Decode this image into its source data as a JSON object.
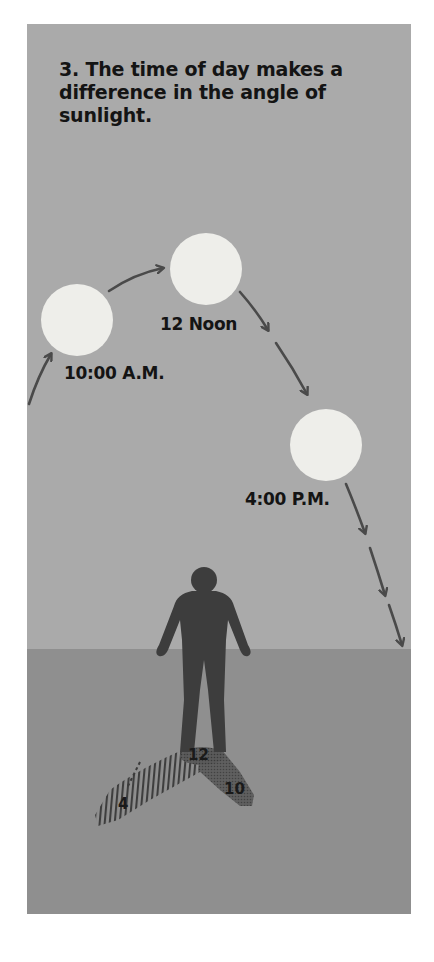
{
  "figure": {
    "title": "3. The time of day makes a difference in the angle of sunlight.",
    "colors": {
      "sky": "#aaaaaa",
      "ground": "#8f8f8f",
      "sun": "#eeeeea",
      "person": "#3d3d3d",
      "arrow": "#4a4a4a",
      "text": "#141414"
    },
    "suns": [
      {
        "id": "sun-10am",
        "label": "10:00 A.M."
      },
      {
        "id": "sun-noon",
        "label": "12 Noon"
      },
      {
        "id": "sun-4pm",
        "label": "4:00 P.M."
      }
    ],
    "shadows": [
      {
        "id": "shadow-noon",
        "label": "12"
      },
      {
        "id": "shadow-10am",
        "label": "10"
      },
      {
        "id": "shadow-4pm",
        "label": "4"
      }
    ]
  }
}
